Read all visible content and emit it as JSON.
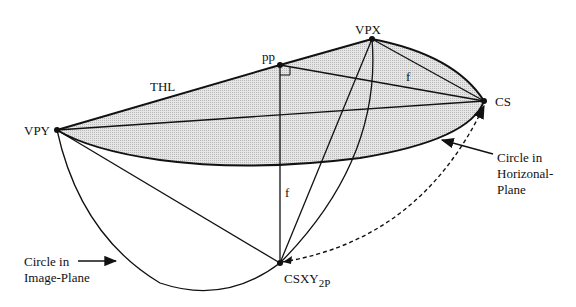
{
  "diagram": {
    "points": {
      "vpy": {
        "label": "VPY",
        "x": 57,
        "y": 130
      },
      "pp": {
        "label": "pp",
        "x": 280,
        "y": 65
      },
      "vpx": {
        "label": "VPX",
        "x": 372,
        "y": 39
      },
      "cs": {
        "label": "CS",
        "x": 484,
        "y": 101
      },
      "csxy2p": {
        "label": "CSXY",
        "subscript": "2P",
        "x": 280,
        "y": 263
      }
    },
    "edge_labels": {
      "thl": "THL",
      "f_horizontal": "f",
      "f_vertical": "f"
    },
    "annotations": {
      "horizontal_circle": {
        "line1": "Circle in",
        "line2": "Horizonal-",
        "line3": "Plane"
      },
      "image_circle": {
        "line1": "Circle in",
        "line2": "Image-Plane"
      }
    },
    "colors": {
      "ink": "#111111",
      "shade": "#d4d4d4",
      "background": "#ffffff"
    }
  }
}
